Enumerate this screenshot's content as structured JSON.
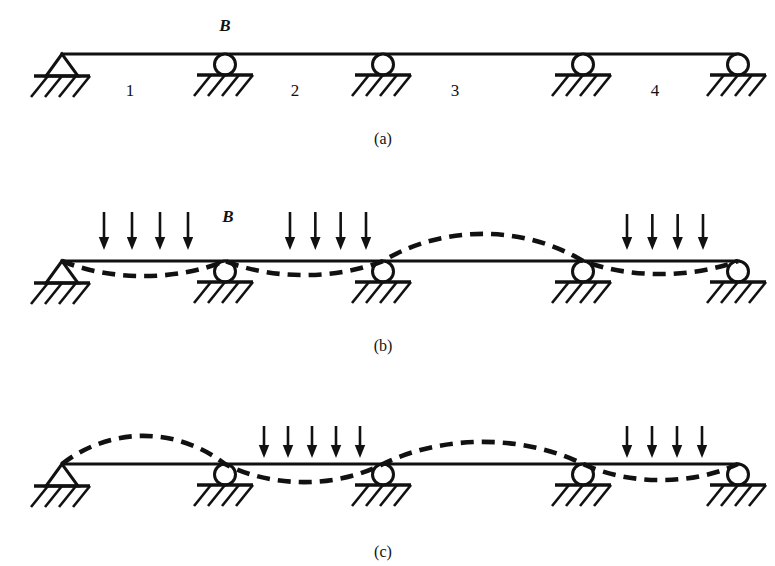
{
  "figure": {
    "width": 775,
    "height": 566,
    "ink_color": "#111111",
    "background_color": "#ffffff",
    "support_x": [
      62,
      225,
      383,
      583,
      738
    ],
    "support_types": [
      "pin",
      "roller",
      "roller",
      "roller",
      "roller"
    ],
    "panels": [
      {
        "id": "a",
        "caption": "(a)",
        "caption_x": 383,
        "caption_y": 144,
        "beam_y": 54,
        "point_label": "B",
        "point_label_x": 225,
        "point_label_y": 31,
        "span_labels": [
          {
            "text": "1",
            "x": 130,
            "y": 96
          },
          {
            "text": "2",
            "x": 295,
            "y": 96
          },
          {
            "text": "3",
            "x": 455,
            "y": 96
          },
          {
            "text": "4",
            "x": 655,
            "y": 96
          }
        ],
        "loaded_spans": [],
        "deflection": []
      },
      {
        "id": "b",
        "caption": "(b)",
        "caption_x": 383,
        "caption_y": 351,
        "beam_y": 261,
        "point_label": "B",
        "point_label_x": 228,
        "point_label_y": 222,
        "span_labels": [],
        "loaded_spans": [
          {
            "span": 1,
            "arrow_count": 4,
            "x_start": 104,
            "x_end": 188,
            "y_top": 212,
            "y_bottom": 250
          },
          {
            "span": 2,
            "arrow_count": 4,
            "x_start": 290,
            "x_end": 366,
            "y_top": 212,
            "y_bottom": 250
          },
          {
            "span": 4,
            "arrow_count": 4,
            "x_start": 627,
            "x_end": 703,
            "y_top": 214,
            "y_bottom": 250
          }
        ],
        "deflection": [
          {
            "span": 1,
            "direction": "down",
            "amplitude": 15
          },
          {
            "span": 2,
            "direction": "down",
            "amplitude": 14
          },
          {
            "span": 3,
            "direction": "up",
            "amplitude": 27
          },
          {
            "span": 4,
            "direction": "down",
            "amplitude": 13
          }
        ]
      },
      {
        "id": "c",
        "caption": "(c)",
        "caption_x": 383,
        "caption_y": 557,
        "beam_y": 464,
        "point_label": "",
        "point_label_x": 0,
        "point_label_y": 0,
        "span_labels": [],
        "loaded_spans": [
          {
            "span": 2,
            "arrow_count": 5,
            "x_start": 264,
            "x_end": 360,
            "y_top": 426,
            "y_bottom": 458
          },
          {
            "span": 4,
            "arrow_count": 4,
            "x_start": 627,
            "x_end": 702,
            "y_top": 426,
            "y_bottom": 458
          }
        ],
        "deflection": [
          {
            "span": 1,
            "direction": "up",
            "amplitude": 28
          },
          {
            "span": 2,
            "direction": "down",
            "amplitude": 18
          },
          {
            "span": 3,
            "direction": "up",
            "amplitude": 22
          },
          {
            "span": 4,
            "direction": "down",
            "amplitude": 16
          }
        ]
      }
    ]
  }
}
